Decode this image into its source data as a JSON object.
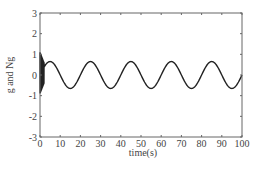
{
  "chart_data": {
    "type": "line",
    "title": "",
    "xlabel": "time(s)",
    "ylabel": "g and Ng",
    "xlim": [
      0,
      100
    ],
    "ylim": [
      -3,
      3
    ],
    "xticks": [
      0,
      10,
      20,
      30,
      40,
      50,
      60,
      70,
      80,
      90,
      100
    ],
    "yticks": [
      -3,
      -2,
      -1,
      0,
      1,
      2,
      3
    ],
    "grid": false,
    "legend": null,
    "series": [
      {
        "name": "g and Ng",
        "description": "Dense high-frequency transient oscillation between about -0.9 and 1.1 for t in [0, 2], then a steady sinusoid with amplitude ~0.65 and period ~20 s",
        "transient": {
          "t_start": 0,
          "t_end": 2,
          "min": -0.9,
          "max": 1.1
        },
        "steady": {
          "amplitude": 0.65,
          "period": 20,
          "peaks_at": [
            5,
            25,
            45,
            65,
            85
          ],
          "troughs_at": [
            15,
            35,
            55,
            75,
            95
          ]
        },
        "x": [
          2,
          5,
          10,
          15,
          20,
          25,
          30,
          35,
          40,
          45,
          50,
          55,
          60,
          65,
          70,
          75,
          80,
          85,
          90,
          95,
          100
        ],
        "y": [
          0.3,
          0.65,
          0,
          -0.65,
          0,
          0.65,
          0,
          -0.65,
          0,
          0.65,
          0,
          -0.65,
          0,
          0.65,
          0,
          -0.65,
          0,
          0.65,
          0,
          -0.65,
          0
        ]
      }
    ],
    "colors": {
      "line": "#222222",
      "axes": "#666666"
    }
  }
}
